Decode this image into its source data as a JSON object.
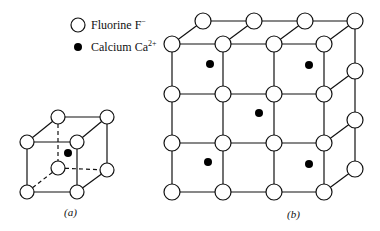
{
  "legend": {
    "items": [
      {
        "symbol": "open-circle",
        "label": "Fluorine F",
        "charge": "−"
      },
      {
        "symbol": "filled-dot",
        "label": "Calcium Ca",
        "charge": "2+"
      }
    ]
  },
  "figures": {
    "a": {
      "caption": "(a)"
    },
    "b": {
      "caption": "(b)"
    }
  },
  "colors": {
    "line": "#111111",
    "fill_fluorine": "#ffffff",
    "fill_calcium": "#000000"
  }
}
